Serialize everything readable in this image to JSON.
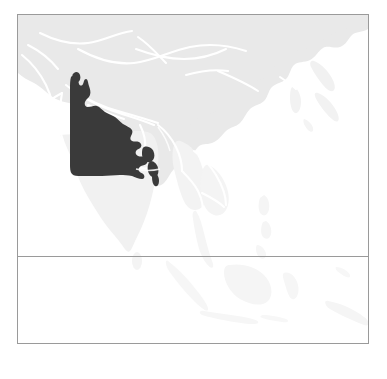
{
  "figure": {
    "kind": "locator-map",
    "region_label": "Indo-Gangetic Plain",
    "continent_label": "Asia",
    "caption": "",
    "title": ""
  },
  "colors": {
    "page_background": "#ffffff",
    "frame_border": "#9a9a9a",
    "divider": "#9a9a9a",
    "ocean": "#ffffff",
    "land_primary": "#e9e9e9",
    "land_faint": "#f4f4f4",
    "land_very_faint": "#f8f8f8",
    "country_border": "#ffffff",
    "highlight_fill": "#3a3a3a"
  },
  "frame": {
    "left": 17,
    "top": 14,
    "width": 352,
    "height": 330,
    "divider_y": 241
  },
  "map": {
    "projection_note": "equirectangular, Asia extent",
    "landmasses": [
      {
        "name": "asia-mainland",
        "shade": "land_primary"
      },
      {
        "name": "india-peninsula",
        "shade": "land_faint"
      },
      {
        "name": "southeast-asia",
        "shade": "land_very_faint"
      },
      {
        "name": "japan",
        "shade": "land_very_faint"
      },
      {
        "name": "korea",
        "shade": "land_very_faint"
      },
      {
        "name": "indonesia",
        "shade": "land_very_faint"
      },
      {
        "name": "philippines",
        "shade": "land_very_faint"
      },
      {
        "name": "sri-lanka",
        "shade": "land_very_faint"
      }
    ],
    "highlighted_region": {
      "name": "indo-gangetic-plain",
      "fill": "#3a3a3a",
      "includes": [
        "Northern India",
        "Ganges Basin",
        "Bangladesh"
      ]
    }
  },
  "labels": {
    "visible_text": []
  }
}
